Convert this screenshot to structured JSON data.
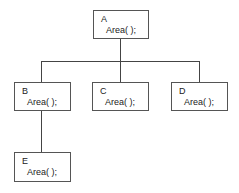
{
  "diagram": {
    "type": "class-hierarchy-tree",
    "nodes": {
      "A": {
        "name": "A",
        "method": "Area( );"
      },
      "B": {
        "name": "B",
        "method": "Area( );"
      },
      "C": {
        "name": "C",
        "method": "Area( );"
      },
      "D": {
        "name": "D",
        "method": "Area( );"
      },
      "E": {
        "name": "E",
        "method": "Area( );"
      }
    },
    "edges": [
      {
        "from": "A",
        "to": "B"
      },
      {
        "from": "A",
        "to": "C"
      },
      {
        "from": "A",
        "to": "D"
      },
      {
        "from": "B",
        "to": "E"
      }
    ]
  }
}
